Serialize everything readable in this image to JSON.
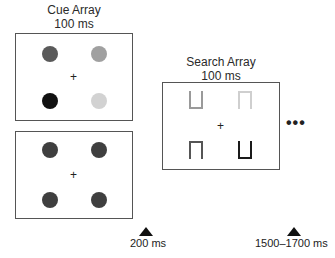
{
  "cue_array": {
    "title": "Cue Array",
    "duration": "100 ms",
    "fixation": "+",
    "dots": [
      {
        "position": "top-left",
        "color": "#5a5a5a"
      },
      {
        "position": "top-right",
        "color": "#a0a0a0"
      },
      {
        "position": "bottom-left",
        "color": "#111111"
      },
      {
        "position": "bottom-right",
        "color": "#d2d2d2"
      }
    ]
  },
  "placeholder_array": {
    "fixation": "+",
    "dots": [
      {
        "position": "top-left",
        "color": "#3f3f3f"
      },
      {
        "position": "top-right",
        "color": "#3f3f3f"
      },
      {
        "position": "bottom-left",
        "color": "#3f3f3f"
      },
      {
        "position": "bottom-right",
        "color": "#3f3f3f"
      }
    ]
  },
  "search_array": {
    "title": "Search Array",
    "duration": "100 ms",
    "fixation": "+",
    "shapes": [
      {
        "position": "top-left",
        "type": "cup",
        "color": "#9a9a9a"
      },
      {
        "position": "top-right",
        "type": "arch",
        "color": "#cfcfcf"
      },
      {
        "position": "bottom-left",
        "type": "arch",
        "color": "#555555"
      },
      {
        "position": "bottom-right",
        "type": "cup",
        "color": "#1a1a1a"
      }
    ],
    "continuation": "•••"
  },
  "timeline": {
    "markers": [
      {
        "label": "200 ms"
      },
      {
        "label": "1500–1700 ms"
      }
    ]
  }
}
